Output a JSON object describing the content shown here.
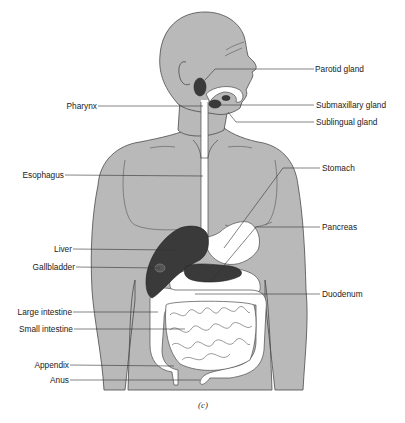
{
  "figure": {
    "caption": "(c)",
    "colors": {
      "body_fill": "#b9b9b9",
      "outline": "#4a4a4a",
      "dark_organ": "#3a3a3a",
      "tract_fill": "#ffffff",
      "leader_line": "#333333"
    }
  },
  "labels_left": [
    {
      "id": "pharynx",
      "text": "Pharynx"
    },
    {
      "id": "esophagus",
      "text": "Esophagus"
    },
    {
      "id": "liver",
      "text": "Liver"
    },
    {
      "id": "gallbladder",
      "text": "Gallbladder"
    },
    {
      "id": "large-intestine",
      "text": "Large intestine"
    },
    {
      "id": "small-intestine",
      "text": "Small intestine"
    },
    {
      "id": "appendix",
      "text": "Appendix"
    },
    {
      "id": "anus",
      "text": "Anus"
    }
  ],
  "labels_right": [
    {
      "id": "parotid-gland",
      "text": "Parotid gland"
    },
    {
      "id": "submaxillary-gland",
      "text": "Submaxillary gland"
    },
    {
      "id": "sublingual-gland",
      "text": "Sublingual gland"
    },
    {
      "id": "stomach",
      "text": "Stomach"
    },
    {
      "id": "pancreas",
      "text": "Pancreas"
    },
    {
      "id": "duodenum",
      "text": "Duodenum"
    }
  ]
}
